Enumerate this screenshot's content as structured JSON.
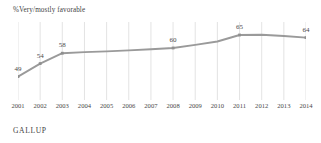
{
  "chart_data": {
    "type": "line",
    "title": "%Very/mostly favorable",
    "xlabel": "",
    "ylabel": "",
    "ylim": [
      40,
      70
    ],
    "grid": "vertical",
    "legend": "none",
    "categories": [
      "2001",
      "2002",
      "2003",
      "2004",
      "2005",
      "2006",
      "2007",
      "2008",
      "2009",
      "2010",
      "2011",
      "2012",
      "2013",
      "2014"
    ],
    "series": [
      {
        "name": "%Very/mostly favorable",
        "color": "#9a9a9a",
        "values": [
          49,
          54,
          58,
          58.4,
          58.7,
          59.1,
          59.5,
          60,
          61.2,
          62.5,
          65,
          65.1,
          64.6,
          64
        ],
        "labeled_points": [
          {
            "x": "2001",
            "value": 49
          },
          {
            "x": "2002",
            "value": 54
          },
          {
            "x": "2003",
            "value": 58
          },
          {
            "x": "2008",
            "value": 60
          },
          {
            "x": "2011",
            "value": 65
          },
          {
            "x": "2014",
            "value": 64
          }
        ]
      }
    ]
  },
  "footer": {
    "brand": "GALLUP"
  },
  "colors": {
    "line": "#9a9a9a",
    "marker": "#8f8f8f",
    "gridline": "#dcdcdc",
    "text": "#4a4a4a"
  }
}
